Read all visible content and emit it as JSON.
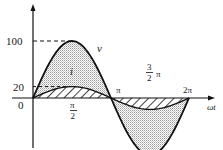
{
  "chart_data": {
    "type": "line",
    "title": "",
    "xlabel": "ωt",
    "ylabel": "",
    "x_ticks": [
      "0",
      "π/2",
      "π",
      "3/2 π",
      "2π"
    ],
    "y_ticks": [
      "0",
      "20",
      "100"
    ],
    "ylim": [
      -100,
      100
    ],
    "xlim": [
      0,
      6.2832
    ],
    "grid": false,
    "series": [
      {
        "name": "v",
        "description": "voltage sinusoid, peak 100 at π/2, shaded (stippled) area under curve",
        "amplitude": 100,
        "x": [
          0,
          0.785,
          1.571,
          2.356,
          3.1416,
          3.927,
          4.712,
          5.498,
          6.2832
        ],
        "values": [
          0,
          70.7,
          100,
          70.7,
          0,
          -70.7,
          -100,
          -70.7,
          0
        ]
      },
      {
        "name": "i",
        "description": "current sinusoid in phase with v, peak 20 at π/2, hatched area under curve",
        "amplitude": 20,
        "x": [
          0,
          0.785,
          1.571,
          2.356,
          3.1416,
          3.927,
          4.712,
          5.498,
          6.2832
        ],
        "values": [
          0,
          14.1,
          20,
          14.1,
          0,
          -14.1,
          -20,
          -14.1,
          0
        ]
      }
    ],
    "annotations": [
      {
        "text": "v",
        "near": "voltage curve, right of peak"
      },
      {
        "text": "i",
        "near": "inside shaded area above current curve"
      },
      {
        "text": "100",
        "type": "dashed reference to peak of v"
      },
      {
        "text": "20",
        "type": "dashed reference to peak of i"
      }
    ]
  },
  "labels": {
    "y100": "100",
    "y20": "20",
    "origin": "0",
    "v": "v",
    "i": "i",
    "pi_half_num": "π",
    "pi_half_den": "2",
    "pi": "π",
    "three_half_num": "3",
    "three_half_den": "2",
    "three_half_pi": "π",
    "two_pi": "2π",
    "xaxis": "ωt"
  },
  "colors": {
    "stroke": "#111111",
    "stipple": "#b8b8b8",
    "background": "#ffffff"
  }
}
